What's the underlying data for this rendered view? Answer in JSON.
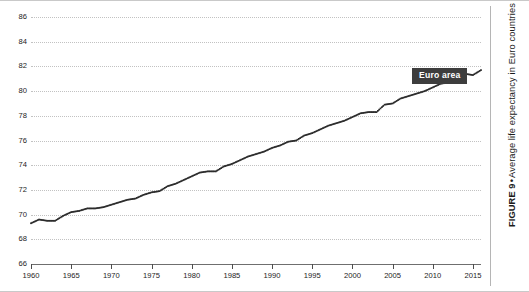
{
  "figure": {
    "caption_label": "FIGURE 9",
    "caption_separator": "•",
    "caption_text": "Average life expectancy in Euro countries"
  },
  "series_callout": {
    "label": "Euro area",
    "background_color": "#3d3d3d",
    "text_color": "#ffffff"
  },
  "chart_data": {
    "type": "line",
    "title": "Average life expectancy in Euro countries",
    "xlabel": "",
    "ylabel": "",
    "xlim": [
      1960,
      2016
    ],
    "ylim": [
      66,
      86
    ],
    "grid": true,
    "legend_position": "inline-callout",
    "yticks": [
      66,
      68,
      70,
      72,
      74,
      76,
      78,
      80,
      82,
      84,
      86
    ],
    "xticks": [
      1960,
      1965,
      1970,
      1975,
      1980,
      1985,
      1990,
      1995,
      2000,
      2005,
      2010,
      2015
    ],
    "marker": "dot",
    "line_color": "#2b2b2b",
    "grid_color": "#c2c2c2",
    "series": [
      {
        "name": "Euro area",
        "x": [
          1960,
          1961,
          1962,
          1963,
          1964,
          1965,
          1966,
          1967,
          1968,
          1969,
          1970,
          1971,
          1972,
          1973,
          1974,
          1975,
          1976,
          1977,
          1978,
          1979,
          1980,
          1981,
          1982,
          1983,
          1984,
          1985,
          1986,
          1987,
          1988,
          1989,
          1990,
          1991,
          1992,
          1993,
          1994,
          1995,
          1996,
          1997,
          1998,
          1999,
          2000,
          2001,
          2002,
          2003,
          2004,
          2005,
          2006,
          2007,
          2008,
          2009,
          2010,
          2011,
          2012,
          2013,
          2014,
          2015,
          2016
        ],
        "values": [
          69.3,
          69.6,
          69.5,
          69.5,
          69.9,
          70.2,
          70.3,
          70.5,
          70.5,
          70.6,
          70.8,
          71.0,
          71.2,
          71.3,
          71.6,
          71.8,
          71.9,
          72.3,
          72.5,
          72.8,
          73.1,
          73.4,
          73.5,
          73.5,
          73.9,
          74.1,
          74.4,
          74.7,
          74.9,
          75.1,
          75.4,
          75.6,
          75.9,
          76.0,
          76.4,
          76.6,
          76.9,
          77.2,
          77.4,
          77.6,
          77.9,
          78.2,
          78.3,
          78.3,
          78.9,
          79.0,
          79.4,
          79.6,
          79.8,
          80.0,
          80.3,
          80.6,
          80.7,
          81.0,
          81.4,
          81.3,
          81.7
        ]
      }
    ]
  }
}
